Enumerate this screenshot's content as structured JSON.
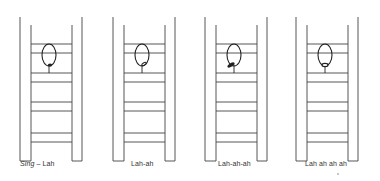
{
  "figure": {
    "stroke_color": "#444444",
    "ink_color": "#222222",
    "ladders": [
      {
        "id": "ladder-1",
        "x": 20,
        "caption_prefix": "Sing",
        "caption_separator": " – ",
        "caption": "Lah",
        "caption_x": 20,
        "mark": "dot-bottom",
        "mark_dx": 0
      },
      {
        "id": "ladder-2",
        "x": 113,
        "caption_prefix": "",
        "caption_separator": "",
        "caption": "Lah-ah",
        "caption_x": 131,
        "mark": "slash-small",
        "mark_dx": 2
      },
      {
        "id": "ladder-3",
        "x": 205,
        "caption_prefix": "",
        "caption_separator": "",
        "caption": "Lah-ah-ah",
        "caption_x": 218,
        "mark": "slash-large",
        "mark_dx": -3
      },
      {
        "id": "ladder-4",
        "x": 296,
        "caption_prefix": "",
        "caption_separator": "",
        "caption": "Lah ah ah ah",
        "caption_x": 305,
        "mark": "open-bottom",
        "mark_dx": 0
      }
    ]
  }
}
